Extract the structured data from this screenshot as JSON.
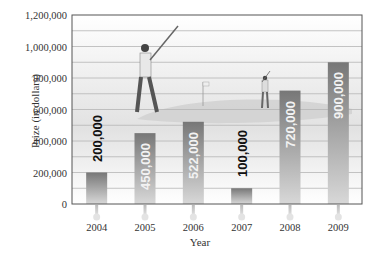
{
  "chart_data": {
    "type": "bar",
    "title": "",
    "xlabel": "Year",
    "ylabel": "Prize (in dollars)",
    "categories": [
      "2004",
      "2005",
      "2006",
      "2007",
      "2008",
      "2009"
    ],
    "values": [
      200000,
      450000,
      522000,
      100000,
      720000,
      900000
    ],
    "data_labels": [
      "200,000",
      "450,000",
      "522,000",
      "100,000",
      "720,000",
      "900,000"
    ],
    "ylim": [
      0,
      1200000
    ],
    "yticks": [
      0,
      200000,
      400000,
      600000,
      800000,
      1000000,
      1200000
    ],
    "ytick_labels": [
      "0",
      "200,000",
      "400,000",
      "600,000",
      "800,000",
      "1,000,000",
      "1,200,000"
    ],
    "grid": true,
    "minor_grid_step": 100000,
    "legend": null,
    "background_illustration": "golfers on a golf course"
  },
  "colors": {
    "bar_top": "#7a7a7a",
    "bar_bottom": "#d6d6d6",
    "grid": "#b5b5b5",
    "axis": "#555555",
    "label_dark": "#111111",
    "label_light": "#f2f2f2"
  }
}
